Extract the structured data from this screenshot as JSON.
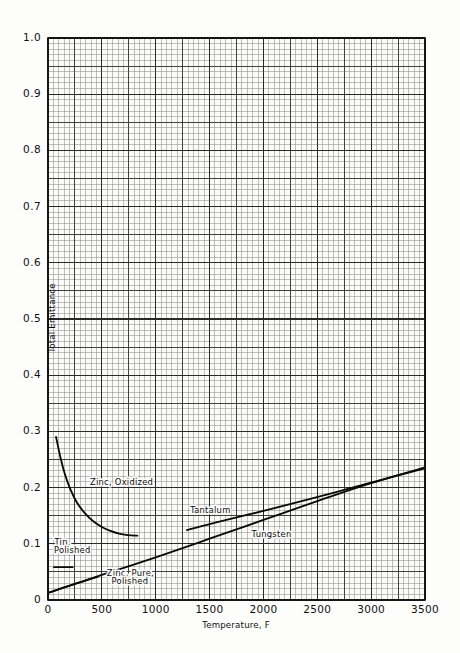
{
  "figure": {
    "background_color": "#fdfdfc",
    "plot_background_color": "#fbfbfa",
    "grid_minor_color": "#8e8e8e",
    "grid_major_color": "#3a3a3a",
    "axis_color": "#111111",
    "curve_color": "#0a0a0a"
  },
  "chart_data": {
    "type": "line",
    "title": "",
    "subtitle": "",
    "xlabel": "Temperature, F",
    "ylabel": "Total Emittance",
    "xlim": [
      0,
      3500
    ],
    "ylim": [
      0,
      1.0
    ],
    "xticks": [
      0,
      500,
      1000,
      1500,
      2000,
      2500,
      3000,
      3500
    ],
    "xtick_labels": [
      "0",
      "500",
      "1000",
      "1500",
      "2000",
      "2500",
      "3000",
      "3500"
    ],
    "yticks": [
      0,
      0.1,
      0.2,
      0.3,
      0.4,
      0.5,
      0.6,
      0.7,
      0.8,
      0.9,
      1.0
    ],
    "ytick_labels": [
      "0",
      "0.1",
      "0.2",
      "0.3",
      "0.4",
      "0.5",
      "0.6",
      "0.7",
      "0.8",
      "0.9",
      "1.0"
    ],
    "grid": true,
    "grid_minor_step_x": 50,
    "grid_minor_step_y": 0.01,
    "grid_major_step_x": 250,
    "grid_major_step_y": 0.05,
    "legend_position": "inline-annotations",
    "series": [
      {
        "name": "Zinc, Oxidized",
        "label": "Zinc, Oxidized",
        "label_x": 390,
        "label_y": 0.205,
        "points": [
          [
            75,
            0.29
          ],
          [
            120,
            0.25
          ],
          [
            160,
            0.222
          ],
          [
            210,
            0.196
          ],
          [
            270,
            0.173
          ],
          [
            340,
            0.155
          ],
          [
            420,
            0.14
          ],
          [
            500,
            0.13
          ],
          [
            580,
            0.123
          ],
          [
            660,
            0.118
          ],
          [
            740,
            0.1155
          ],
          [
            830,
            0.1145
          ]
        ]
      },
      {
        "name": "Tin, Polished",
        "label": "Tin, Polished",
        "label_lines": [
          "Tin,",
          "Polished"
        ],
        "label_x": 60,
        "label_y": 0.092,
        "points": [
          [
            55,
            0.0585
          ],
          [
            230,
            0.0585
          ]
        ]
      },
      {
        "name": "Zinc, Pure, Polished",
        "label": "Zinc, Pure, Polished",
        "label_lines": [
          "Zinc, Pure,",
          "Polished"
        ],
        "label_x": 540,
        "label_y": 0.0415,
        "points": [
          [
            0,
            0.0125
          ],
          [
            200,
            0.0255
          ],
          [
            400,
            0.0375
          ],
          [
            460,
            0.041
          ]
        ]
      },
      {
        "name": "Tantalum",
        "label": "Tantalum",
        "label_x": 1310,
        "label_y": 0.153,
        "points": [
          [
            0,
            0.0125
          ],
          [
            500,
            0.0445
          ],
          [
            1000,
            0.076
          ],
          [
            1500,
            0.109
          ],
          [
            2000,
            0.1425
          ],
          [
            2500,
            0.176
          ],
          [
            3000,
            0.208
          ],
          [
            3500,
            0.236
          ]
        ]
      },
      {
        "name": "Tungsten",
        "label": "Tungsten",
        "label_x": 1880,
        "label_y": 0.1105,
        "points": [
          [
            1290,
            0.1245
          ],
          [
            1600,
            0.14
          ],
          [
            2000,
            0.1585
          ],
          [
            2400,
            0.178
          ],
          [
            2800,
            0.1985
          ],
          [
            3200,
            0.219
          ],
          [
            3500,
            0.2345
          ]
        ]
      }
    ],
    "annotations": [
      {
        "text": "Zinc, Oxidized",
        "x": 390,
        "y": 0.205
      },
      {
        "text": "Tin,",
        "x": 60,
        "y": 0.098
      },
      {
        "text": "Polished",
        "x": 55,
        "y": 0.083
      },
      {
        "text": "Zinc, Pure,",
        "x": 545,
        "y": 0.0435
      },
      {
        "text": "Polished",
        "x": 590,
        "y": 0.0285
      },
      {
        "text": "Tantalum",
        "x": 1320,
        "y": 0.1545
      },
      {
        "text": "Tungsten",
        "x": 1890,
        "y": 0.1125
      }
    ]
  }
}
